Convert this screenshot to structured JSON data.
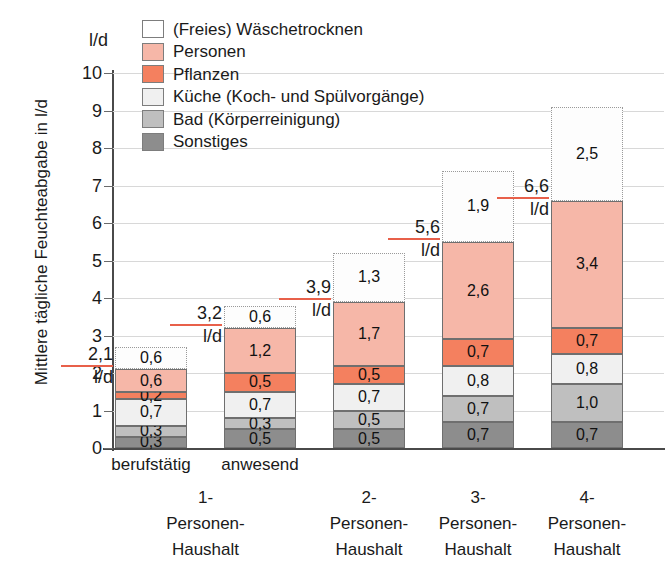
{
  "chart_data": {
    "type": "bar",
    "title": "",
    "ylabel": "Mittlere tägliche Feuchteabgabe in l/d",
    "xlabel": "",
    "unit": "l/d",
    "ylim": [
      0,
      10
    ],
    "ytick_labels": [
      "0",
      "1",
      "2",
      "3",
      "4",
      "5",
      "6",
      "7",
      "8",
      "9",
      "10"
    ],
    "grid": true,
    "legend_position": "top-center",
    "stacked": true,
    "categories": [
      "1-Personen-Haushalt berufstätig",
      "1-Personen-Haushalt anwesend",
      "2-Personen-Haushalt",
      "3-Personen-Haushalt",
      "4-Personen-Haushalt"
    ],
    "series": [
      {
        "name": "Sonstiges",
        "color": "#8d8d8d",
        "values": [
          0.3,
          0.5,
          0.5,
          0.7,
          0.7
        ]
      },
      {
        "name": "Bad (Körperreinigung)",
        "color": "#bfbfbf",
        "values": [
          0.3,
          0.3,
          0.5,
          0.7,
          1.0
        ]
      },
      {
        "name": "Küche (Koch- und Spülvorgänge)",
        "color": "#f0f0f0",
        "values": [
          0.7,
          0.7,
          0.7,
          0.8,
          0.8
        ]
      },
      {
        "name": "Pflanzen",
        "color": "#f4805f",
        "values": [
          0.2,
          0.5,
          0.5,
          0.7,
          0.7
        ]
      },
      {
        "name": "Personen",
        "color": "#f6b7a8",
        "values": [
          0.6,
          1.2,
          1.7,
          2.6,
          3.4
        ]
      },
      {
        "name": "(Freies) Wäschetrocknen",
        "color": "#ffffff",
        "values": [
          0.6,
          0.6,
          1.3,
          1.9,
          2.5
        ]
      }
    ],
    "totals": [
      "2,1",
      "3,2",
      "3,9",
      "5,6",
      "6,6"
    ],
    "total_unit": "l/d",
    "value_labels": [
      [
        "0,3",
        "0,3",
        "0,7",
        "0,2",
        "0,6",
        "0,6"
      ],
      [
        "0,5",
        "0,3",
        "0,7",
        "0,5",
        "1,2",
        "0,6"
      ],
      [
        "0,5",
        "0,5",
        "0,7",
        "0,5",
        "1,7",
        "1,3"
      ],
      [
        "0,7",
        "0,7",
        "0,8",
        "0,7",
        "2,6",
        "1,9"
      ],
      [
        "0,7",
        "1,0",
        "0,8",
        "0,7",
        "3,4",
        "2,5"
      ]
    ]
  },
  "legend": {
    "items": [
      {
        "label": "(Freies) Wäschetrocknen"
      },
      {
        "label": "Personen"
      },
      {
        "label": "Pflanzen"
      },
      {
        "label": "Küche (Koch- und Spülvorgänge)"
      },
      {
        "label": "Bad (Körperreinigung)"
      },
      {
        "label": "Sonstiges"
      }
    ]
  },
  "x_axis": {
    "sub_labels": [
      {
        "text": "berufstätig"
      },
      {
        "text": "anwesend"
      }
    ],
    "groups": [
      {
        "line1": "1-",
        "line2": "Personen-",
        "line3": "Haushalt"
      },
      {
        "line1": "2-",
        "line2": "Personen-",
        "line3": "Haushalt"
      },
      {
        "line1": "3-",
        "line2": "Personen-",
        "line3": "Haushalt"
      },
      {
        "line1": "4-",
        "line2": "Personen-",
        "line3": "Haushalt"
      }
    ]
  },
  "colors": {
    "accent_rule": "#e8604a",
    "axis": "#4a4a4a",
    "grid": "#d8d8d8"
  }
}
